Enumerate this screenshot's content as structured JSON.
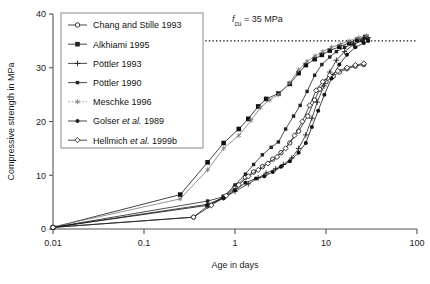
{
  "figure": {
    "background": "#ffffff",
    "axis_color": "#555555",
    "series_color": "#222222"
  },
  "chart_data": {
    "type": "line",
    "title": "",
    "subtitle": "",
    "xlabel": "Age in days",
    "ylabel": "Compressive strength in MPa",
    "xscale": "log",
    "yscale": "linear",
    "xlim": [
      0.01,
      100
    ],
    "ylim": [
      0,
      40
    ],
    "xticks": [
      0.01,
      0.1,
      1,
      10,
      100
    ],
    "xticklabels": [
      "0.01",
      "0.1",
      "1",
      "10",
      "100"
    ],
    "yticks": [
      0,
      10,
      20,
      30,
      40
    ],
    "yticklabels": [
      "0",
      "10",
      "20",
      "30",
      "40"
    ],
    "grid": false,
    "legend_position": "upper-left",
    "annotations": [
      {
        "name": "fcu-threshold",
        "text": "f_cu = 35 MPa",
        "text_main": "f",
        "text_sub": "cu",
        "text_rest": "= 35 MPa",
        "value": 35,
        "unit": "MPa",
        "line_style": "dotted",
        "x_start": 0.1,
        "x_end": 100
      }
    ],
    "series": [
      {
        "name": "Chang and Stille 1993",
        "marker": "open-circle",
        "color": "#222222",
        "points": [
          [
            0.01,
            0.3
          ],
          [
            0.35,
            2.2
          ],
          [
            0.5,
            4.3
          ],
          [
            0.75,
            6.0
          ],
          [
            1.0,
            7.8
          ],
          [
            1.3,
            9.6
          ],
          [
            1.6,
            10.6
          ],
          [
            2.0,
            11.6
          ],
          [
            2.6,
            13.0
          ],
          [
            3.2,
            14.2
          ],
          [
            4.0,
            16.0
          ],
          [
            5.0,
            18.2
          ],
          [
            6.3,
            21.0
          ],
          [
            7.5,
            24.0
          ],
          [
            8.5,
            26.0
          ],
          [
            10.0,
            27.4
          ],
          [
            12.0,
            28.4
          ],
          [
            14.0,
            29.2
          ],
          [
            17.0,
            29.8
          ],
          [
            21.0,
            30.3
          ],
          [
            26.0,
            30.6
          ]
        ]
      },
      {
        "name": "Alkhiami 1995",
        "marker": "filled-square",
        "color": "#111111",
        "points": [
          [
            0.01,
            0.3
          ],
          [
            0.25,
            6.4
          ],
          [
            0.5,
            12.4
          ],
          [
            0.75,
            16.0
          ],
          [
            1.1,
            18.6
          ],
          [
            1.4,
            20.5
          ],
          [
            1.8,
            22.8
          ],
          [
            2.2,
            24.2
          ],
          [
            3.0,
            25.2
          ],
          [
            4.0,
            27.0
          ],
          [
            5.0,
            29.0
          ],
          [
            6.0,
            30.5
          ],
          [
            7.5,
            31.6
          ],
          [
            9.0,
            32.4
          ],
          [
            11.0,
            33.2
          ],
          [
            14.0,
            33.9
          ],
          [
            18.0,
            34.6
          ],
          [
            22.0,
            35.2
          ],
          [
            27.0,
            35.7
          ]
        ]
      },
      {
        "name": "Pöttler 1993",
        "marker": "plus",
        "color": "#222222",
        "points": [
          [
            0.01,
            0.3
          ],
          [
            0.5,
            4.6
          ],
          [
            0.75,
            5.8
          ],
          [
            1.0,
            7.0
          ],
          [
            1.4,
            8.4
          ],
          [
            1.8,
            9.5
          ],
          [
            2.2,
            10.4
          ],
          [
            2.8,
            11.2
          ],
          [
            3.4,
            12.0
          ],
          [
            4.2,
            13.2
          ],
          [
            5.0,
            15.0
          ],
          [
            6.0,
            17.5
          ],
          [
            7.0,
            20.6
          ],
          [
            8.0,
            23.6
          ],
          [
            9.5,
            26.6
          ],
          [
            11.0,
            29.2
          ],
          [
            13.0,
            31.4
          ],
          [
            16.0,
            33.0
          ],
          [
            20.0,
            34.3
          ],
          [
            25.0,
            35.2
          ],
          [
            29.0,
            35.6
          ]
        ]
      },
      {
        "name": "Pöttler 1990",
        "marker": "small-filled-square",
        "color": "#222222",
        "points": [
          [
            0.01,
            0.3
          ],
          [
            0.5,
            5.2
          ],
          [
            0.75,
            6.0
          ],
          [
            1.0,
            8.2
          ],
          [
            1.3,
            10.2
          ],
          [
            1.6,
            12.0
          ],
          [
            2.0,
            13.8
          ],
          [
            2.5,
            15.2
          ],
          [
            3.0,
            16.2
          ],
          [
            3.6,
            18.6
          ],
          [
            4.4,
            21.0
          ],
          [
            5.2,
            23.0
          ],
          [
            6.2,
            25.6
          ],
          [
            7.5,
            28.6
          ],
          [
            9.0,
            30.6
          ],
          [
            11.0,
            32.0
          ],
          [
            13.0,
            33.0
          ],
          [
            16.0,
            33.8
          ],
          [
            20.0,
            34.4
          ],
          [
            25.0,
            35.0
          ],
          [
            29.0,
            35.4
          ]
        ]
      },
      {
        "name": "Meschke 1996",
        "marker": "asterisk",
        "color": "#7a7a7a",
        "points": [
          [
            0.01,
            0.4
          ],
          [
            0.25,
            5.6
          ],
          [
            0.5,
            11.0
          ],
          [
            0.75,
            15.0
          ],
          [
            1.1,
            17.4
          ],
          [
            1.5,
            20.2
          ],
          [
            1.9,
            22.6
          ],
          [
            2.4,
            24.0
          ],
          [
            3.0,
            25.0
          ],
          [
            4.0,
            27.2
          ],
          [
            5.0,
            29.6
          ],
          [
            6.2,
            31.2
          ],
          [
            7.6,
            32.2
          ],
          [
            9.2,
            33.0
          ],
          [
            11.5,
            33.8
          ],
          [
            14.5,
            34.4
          ],
          [
            18.0,
            35.0
          ],
          [
            23.0,
            35.6
          ],
          [
            28.0,
            36.0
          ]
        ]
      },
      {
        "name": "Golser et al. 1989",
        "marker": "filled-circle",
        "color": "#111111",
        "points": [
          [
            0.01,
            0.3
          ],
          [
            0.5,
            4.4
          ],
          [
            0.75,
            5.7
          ],
          [
            1.0,
            7.2
          ],
          [
            1.3,
            8.6
          ],
          [
            1.7,
            9.4
          ],
          [
            2.1,
            9.8
          ],
          [
            2.6,
            10.6
          ],
          [
            3.2,
            11.6
          ],
          [
            4.0,
            12.6
          ],
          [
            5.0,
            14.2
          ],
          [
            6.0,
            16.0
          ],
          [
            7.0,
            19.0
          ],
          [
            8.2,
            22.0
          ],
          [
            9.6,
            25.0
          ],
          [
            11.5,
            28.0
          ],
          [
            14.0,
            30.6
          ],
          [
            17.0,
            32.4
          ],
          [
            21.0,
            33.8
          ],
          [
            26.0,
            34.6
          ],
          [
            29.0,
            35.0
          ]
        ]
      },
      {
        "name": "Hellmich et al. 1999b",
        "marker": "open-diamond",
        "color": "#222222",
        "points": [
          [
            0.01,
            0.3
          ],
          [
            0.35,
            2.2
          ],
          [
            0.55,
            4.4
          ],
          [
            0.8,
            6.2
          ],
          [
            1.1,
            8.2
          ],
          [
            1.4,
            9.8
          ],
          [
            1.8,
            11.0
          ],
          [
            2.3,
            12.2
          ],
          [
            2.9,
            13.4
          ],
          [
            3.6,
            15.0
          ],
          [
            4.5,
            17.4
          ],
          [
            5.5,
            20.0
          ],
          [
            6.6,
            23.0
          ],
          [
            7.8,
            25.8
          ],
          [
            9.2,
            27.4
          ],
          [
            11.0,
            28.6
          ],
          [
            13.5,
            29.4
          ],
          [
            17.0,
            30.0
          ],
          [
            21.0,
            30.5
          ],
          [
            26.0,
            30.8
          ]
        ]
      }
    ]
  },
  "legend": {
    "entries": [
      {
        "label": "Chang and Stille 1993",
        "marker": "open-circle"
      },
      {
        "label": "Alkhiami 1995",
        "marker": "filled-square"
      },
      {
        "label": "Pöttler 1993",
        "marker": "plus"
      },
      {
        "label": "Pöttler 1990",
        "marker": "small-filled-square"
      },
      {
        "label": "Meschke 1996",
        "marker": "asterisk"
      },
      {
        "label": "Golser et al. 1989",
        "marker": "filled-circle",
        "italic_part": "et al."
      },
      {
        "label": "Hellmich et al. 1999b",
        "marker": "open-diamond",
        "italic_part": "et al."
      }
    ]
  }
}
